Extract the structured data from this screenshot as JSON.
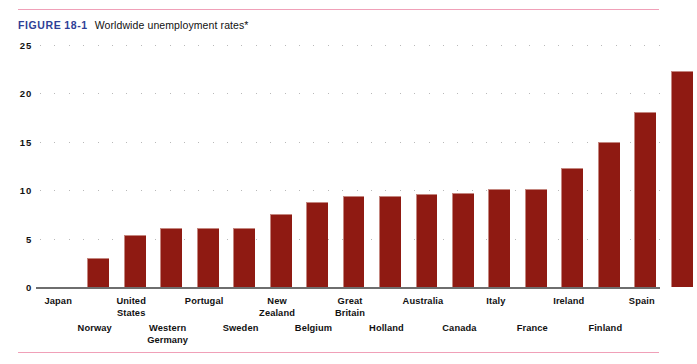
{
  "figure": {
    "figure_word": "FIGURE",
    "figure_number": "18-1",
    "caption": "Worldwide unemployment rates*"
  },
  "colors": {
    "bar": "#8f1a12",
    "bar_highlight": "#c4867f",
    "rule": "#f0a0b8",
    "caption_label": "#2f3f96",
    "gridline_dot": "#b9b9b9",
    "axis": "#6e6e6e"
  },
  "chart_data": {
    "type": "bar",
    "title": "Worldwide unemployment rates*",
    "xlabel": "",
    "ylabel": "",
    "ylim": [
      0,
      25
    ],
    "yticks": [
      0,
      5,
      10,
      15,
      20,
      25
    ],
    "grid": "dotted-rows",
    "legend": "none",
    "categories": [
      "Japan",
      "Norway",
      "United States",
      "Western Germany",
      "Portugal",
      "Sweden",
      "New Zealand",
      "Belgium",
      "Great Britain",
      "Holland",
      "Australia",
      "Canada",
      "Italy",
      "France",
      "Ireland",
      "Finland",
      "Spain"
    ],
    "values": [
      3.0,
      5.4,
      6.1,
      6.1,
      6.1,
      7.5,
      8.8,
      9.4,
      9.4,
      9.6,
      9.7,
      10.1,
      10.1,
      12.3,
      15.0,
      18.1,
      22.3
    ]
  },
  "x_axis": {
    "labels": [
      {
        "lines": [
          "Japan"
        ],
        "row": 0
      },
      {
        "lines": [
          "Norway"
        ],
        "row": 1
      },
      {
        "lines": [
          "United",
          "States"
        ],
        "row": 0
      },
      {
        "lines": [
          "Western",
          "Germany"
        ],
        "row": 1
      },
      {
        "lines": [
          "Portugal"
        ],
        "row": 0
      },
      {
        "lines": [
          "Sweden"
        ],
        "row": 1
      },
      {
        "lines": [
          "New",
          "Zealand"
        ],
        "row": 0
      },
      {
        "lines": [
          "Belgium"
        ],
        "row": 1
      },
      {
        "lines": [
          "Great",
          "Britain"
        ],
        "row": 0
      },
      {
        "lines": [
          "Holland"
        ],
        "row": 1
      },
      {
        "lines": [
          "Australia"
        ],
        "row": 0
      },
      {
        "lines": [
          "Canada"
        ],
        "row": 1
      },
      {
        "lines": [
          "Italy"
        ],
        "row": 0
      },
      {
        "lines": [
          "France"
        ],
        "row": 1
      },
      {
        "lines": [
          "Ireland"
        ],
        "row": 0
      },
      {
        "lines": [
          "Finland"
        ],
        "row": 1
      },
      {
        "lines": [
          "Spain"
        ],
        "row": 0
      }
    ]
  }
}
